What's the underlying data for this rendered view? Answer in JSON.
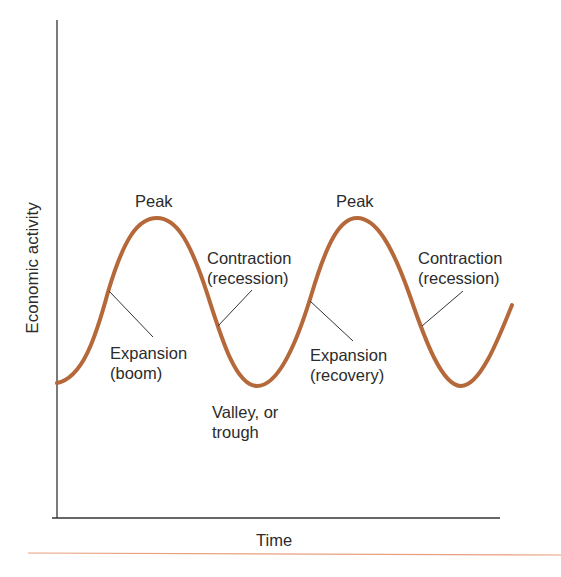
{
  "diagram": {
    "type": "business-cycle",
    "axes": {
      "y_label": "Economic activity",
      "x_label": "Time"
    },
    "labels": {
      "peak_1": "Peak",
      "peak_2": "Peak",
      "contraction_1_line1": "Contraction",
      "contraction_1_line2": "(recession)",
      "contraction_2_line1": "Contraction",
      "contraction_2_line2": "(recession)",
      "expansion_1_line1": "Expansion",
      "expansion_1_line2": "(boom)",
      "expansion_2_line1": "Expansion",
      "expansion_2_line2": "(recovery)",
      "valley_line1": "Valley, or",
      "valley_line2": "trough"
    },
    "colors": {
      "curve": "#b5693a",
      "axis": "#333333",
      "rule": "#e8a080",
      "leader": "#333333"
    }
  }
}
